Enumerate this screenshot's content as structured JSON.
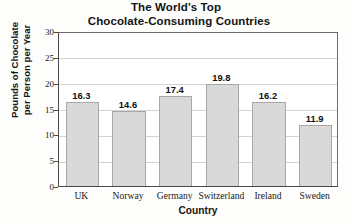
{
  "chart_data": {
    "type": "bar",
    "title": "The World's Top Chocolate-Consuming Countries",
    "title_lines": [
      "The World's Top",
      "Chocolate-Consuming Countries"
    ],
    "categories": [
      "UK",
      "Norway",
      "Germany",
      "Switzerland",
      "Ireland",
      "Sweden"
    ],
    "values": [
      16.3,
      14.6,
      17.4,
      19.8,
      16.2,
      11.9
    ],
    "value_labels": [
      "16.3",
      "14.6",
      "17.4",
      "19.8",
      "16.2",
      "11.9"
    ],
    "xlabel": "Country",
    "ylabel": "Pounds of Chocolate per Person per Year",
    "ylabel_lines": [
      "Pounds of Chocolate",
      "per Person per Year"
    ],
    "ylim": [
      0,
      30
    ],
    "yticks": [
      0,
      5,
      10,
      15,
      20,
      25,
      30
    ],
    "ytick_labels": [
      "0",
      "5",
      "10",
      "15",
      "20",
      "25",
      "30"
    ],
    "grid": "horizontal",
    "legend": "none",
    "bar_color": "#d9d9d9",
    "bar_edge_color": "#a8a8a8",
    "grid_color": "#d3d3d3",
    "axis_color": "#4a4a4a",
    "text_color": "#141414"
  }
}
